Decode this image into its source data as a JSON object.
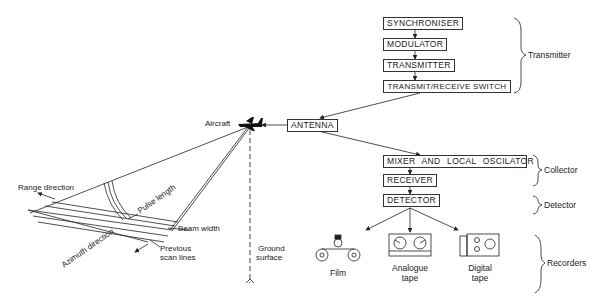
{
  "diagram": {
    "transmitter_chain": [
      "SYNCHRONISER",
      "MODULATOR",
      "TRANSMITTER",
      "TRANSMIT/RECEIVE SWITCH"
    ],
    "antenna": "ANTENNA",
    "collector_chain": [
      "MIXER AND LOCAL OSCILATOR",
      "RECEIVER"
    ],
    "detector": "DETECTOR",
    "groups": {
      "transmitter": "Transmitter",
      "collector": "Collector",
      "detector": "Detector",
      "recorders": "Recorders"
    },
    "recorders": [
      {
        "icon": "film-reel-icon",
        "label_line1": "Film",
        "label_line2": ""
      },
      {
        "icon": "analogue-tape-icon",
        "label_line1": "Analogue",
        "label_line2": "tape"
      },
      {
        "icon": "digital-tape-icon",
        "label_line1": "Digital",
        "label_line2": "tape"
      }
    ],
    "geometry_labels": {
      "aircraft": "Aircraft",
      "range_direction": "Range direction",
      "azimuth_direction": "Azimuth direction",
      "pulse_length": "Pulse length",
      "beam_width": "Beam width",
      "previous_scan_1": "Previous",
      "previous_scan_2": "scan lines",
      "ground_1": "Ground",
      "ground_2": "surface"
    }
  }
}
